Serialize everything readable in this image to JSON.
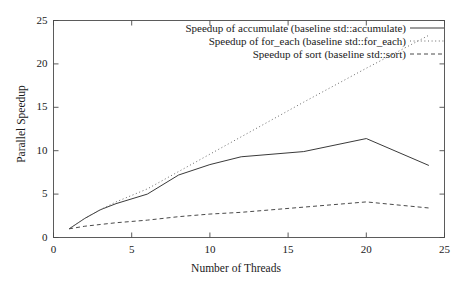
{
  "chart_data": {
    "type": "line",
    "title": "",
    "xlabel": "Number of Threads",
    "ylabel": "Parallel Speedup",
    "xlim": [
      0,
      25
    ],
    "ylim": [
      0,
      25
    ],
    "xticks": [
      0,
      5,
      10,
      15,
      20,
      25
    ],
    "yticks": [
      0,
      5,
      10,
      15,
      20,
      25
    ],
    "xtick_labels": [
      "0",
      "5",
      "10",
      "15",
      "20",
      "25"
    ],
    "ytick_labels": [
      "0",
      "5",
      "10",
      "15",
      "20",
      "25"
    ],
    "grid": false,
    "legend_position": "top-right",
    "series": [
      {
        "name": "Speedup of accumulate (baseline std::accumulate)",
        "style": "solid",
        "color": "#3a3a3a",
        "x": [
          1,
          2,
          3,
          4,
          6,
          8,
          10,
          12,
          16,
          20,
          24
        ],
        "values": [
          1.0,
          2.2,
          3.2,
          3.9,
          5.0,
          7.2,
          8.4,
          9.3,
          9.9,
          11.4,
          8.3
        ]
      },
      {
        "name": "Speedup of for_each (baseline std::for_each)",
        "style": "dotted",
        "color": "#6a6a6a",
        "x": [
          1,
          2,
          3,
          4,
          6,
          8,
          10,
          12,
          16,
          20,
          24
        ],
        "values": [
          1.0,
          2.2,
          3.2,
          4.1,
          5.6,
          7.6,
          9.6,
          11.6,
          15.6,
          19.5,
          23.3
        ]
      },
      {
        "name": "Speedup of sort (baseline std::sort)",
        "style": "dashed",
        "color": "#4a4a4a",
        "x": [
          1,
          2,
          3,
          4,
          6,
          8,
          10,
          12,
          16,
          20,
          24
        ],
        "values": [
          1.0,
          1.3,
          1.5,
          1.7,
          2.0,
          2.4,
          2.7,
          2.9,
          3.5,
          4.1,
          3.4
        ]
      }
    ]
  },
  "axes": {
    "x_label": "Number of Threads",
    "y_label": "Parallel Speedup"
  },
  "legend": {
    "entries": [
      {
        "label": "Speedup of accumulate (baseline std::accumulate)",
        "style": "solid"
      },
      {
        "label": "Speedup of for_each (baseline std::for_each)",
        "style": "dotted"
      },
      {
        "label": "Speedup of sort (baseline std::sort)",
        "style": "dashed"
      }
    ]
  },
  "colors": {
    "axis": "#4a4a4a",
    "text": "#1a1a1a",
    "background": "#ffffff"
  }
}
